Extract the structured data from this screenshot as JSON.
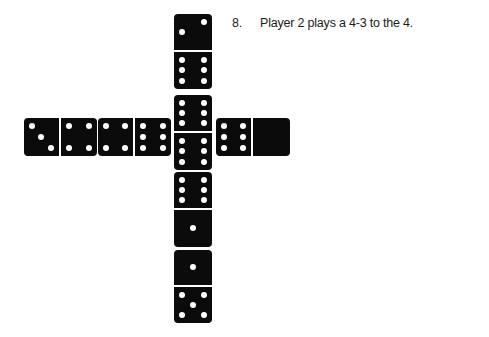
{
  "caption": {
    "number": "8.",
    "text": "Player 2 plays a 4-3 to the 4."
  },
  "board": {
    "description": "Domino train layout forming a cross",
    "background_color": "#ffffff",
    "tile_color": "#0b0b0b",
    "pip_color": "#ffffff",
    "tiles": [
      {
        "id": "vertical-top",
        "orientation": "vertical",
        "values": [
          2,
          6
        ],
        "label": "2-6",
        "x": 174,
        "y": 14,
        "w": 38,
        "h": 75
      },
      {
        "id": "vertical-second",
        "orientation": "vertical",
        "values": [
          6,
          6
        ],
        "label": "6-6",
        "x": 174,
        "y": 95,
        "w": 38,
        "h": 75
      },
      {
        "id": "vertical-third",
        "orientation": "vertical",
        "values": [
          6,
          1
        ],
        "label": "6-1",
        "x": 174,
        "y": 172,
        "w": 38,
        "h": 75
      },
      {
        "id": "vertical-bottom",
        "orientation": "vertical",
        "values": [
          1,
          5
        ],
        "label": "1-5",
        "x": 174,
        "y": 250,
        "w": 38,
        "h": 73
      },
      {
        "id": "left-outer",
        "orientation": "horizontal",
        "values": [
          3,
          4
        ],
        "label": "3-4",
        "x": 24,
        "y": 118,
        "w": 73,
        "h": 38
      },
      {
        "id": "left-inner",
        "orientation": "horizontal",
        "values": [
          4,
          6
        ],
        "label": "4-6",
        "x": 98,
        "y": 118,
        "w": 73,
        "h": 38
      },
      {
        "id": "right-outer",
        "orientation": "horizontal",
        "values": [
          6,
          0
        ],
        "label": "6-blank",
        "x": 216,
        "y": 118,
        "w": 74,
        "h": 38
      }
    ]
  }
}
